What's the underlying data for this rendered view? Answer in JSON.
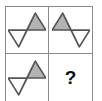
{
  "puzzle": {
    "type": "visual-analogy-matrix",
    "rows": 2,
    "columns": 2,
    "answer_placeholder": "?",
    "colors": {
      "grid_line": "#8a8a8a",
      "shape_outline": "#555555",
      "shape_fill_gray": "#b3b3b3",
      "shape_fill_white": "#ffffff",
      "background": "#ffffff",
      "question_mark": "#111111"
    },
    "cells": [
      {
        "id": "cell-top-left",
        "position": "top-left",
        "content_kind": "figure",
        "figure_name": "bowtie-two-triangles",
        "rotation_deg": -32,
        "triangle_a": {
          "placement": "upper-left",
          "fill": "white"
        },
        "triangle_b": {
          "placement": "lower-right",
          "fill": "gray"
        },
        "label": ""
      },
      {
        "id": "cell-top-right",
        "position": "top-right",
        "content_kind": "figure",
        "figure_name": "bowtie-two-triangles",
        "rotation_deg": 32,
        "triangle_a": {
          "placement": "lower-left",
          "fill": "gray"
        },
        "triangle_b": {
          "placement": "upper-right",
          "fill": "white"
        },
        "label": ""
      },
      {
        "id": "cell-bottom-left",
        "position": "bottom-left",
        "content_kind": "figure",
        "figure_name": "bowtie-two-triangles",
        "rotation_deg": -32,
        "triangle_a": {
          "placement": "upper-right",
          "fill": "gray"
        },
        "triangle_b": {
          "placement": "lower-left",
          "fill": "white"
        },
        "label": ""
      },
      {
        "id": "cell-bottom-right",
        "position": "bottom-right",
        "content_kind": "question",
        "figure_name": "",
        "rotation_deg": 0,
        "label": "?"
      }
    ]
  }
}
